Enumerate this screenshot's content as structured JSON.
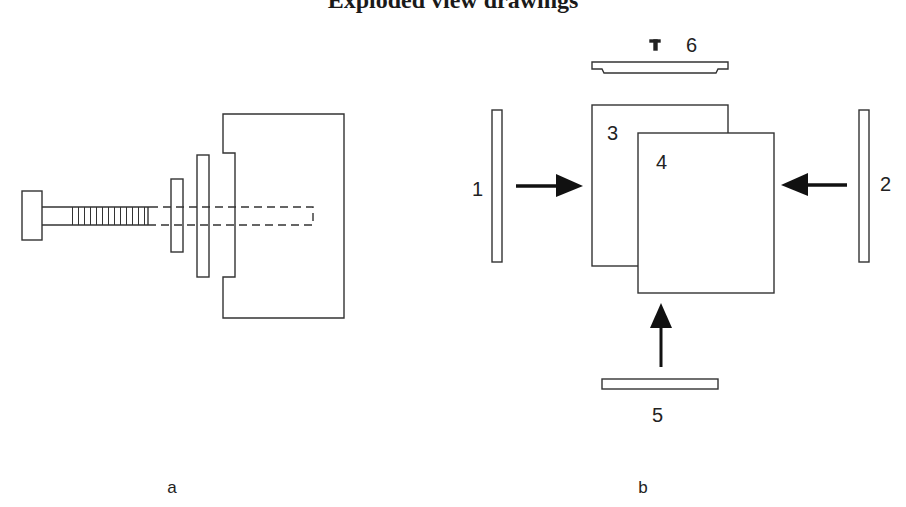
{
  "title": "Exploded view drawings",
  "figure_a": {
    "label": "a",
    "parts": [
      "screw",
      "small-washer",
      "large-washer",
      "housing-block",
      "screw-hole (hidden)"
    ]
  },
  "figure_b": {
    "label": "b",
    "part_labels": [
      "1",
      "2",
      "3",
      "4",
      "5",
      "6"
    ]
  },
  "colors": {
    "line": "#333333",
    "arrow": "#111111",
    "background": "#ffffff"
  }
}
